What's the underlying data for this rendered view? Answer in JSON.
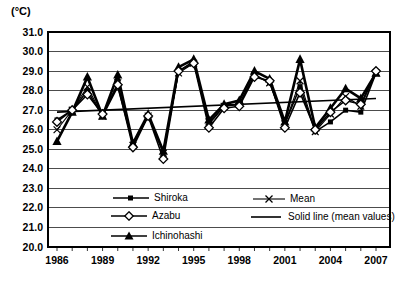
{
  "chart_data": {
    "type": "line",
    "title": "",
    "y_unit_label": "(°C)",
    "xlabel": "",
    "ylabel": "",
    "ylim": [
      20.0,
      31.0
    ],
    "ytick_step": 1.0,
    "grid": true,
    "line_color": "#000000",
    "x": [
      1986,
      1987,
      1988,
      1989,
      1990,
      1991,
      1992,
      1993,
      1994,
      1995,
      1996,
      1997,
      1998,
      1999,
      2000,
      2001,
      2002,
      2003,
      2004,
      2005,
      2006,
      2007
    ],
    "x_axis_tick_labels": [
      "1986",
      "1989",
      "1992",
      "1995",
      "1998",
      "2001",
      "2004",
      "2007"
    ],
    "series": [
      {
        "name": "Shiroka",
        "marker": "filled-square",
        "values": [
          26.5,
          27.0,
          28.0,
          26.7,
          28.2,
          25.3,
          26.7,
          24.9,
          29.0,
          29.5,
          26.3,
          27.2,
          27.3,
          28.8,
          28.4,
          26.3,
          28.2,
          25.9,
          26.4,
          27.0,
          26.9,
          28.9
        ]
      },
      {
        "name": "Azabu",
        "marker": "open-diamond",
        "values": [
          26.4,
          27.0,
          27.8,
          26.8,
          28.3,
          25.1,
          26.7,
          24.5,
          29.0,
          29.4,
          26.1,
          27.1,
          27.2,
          28.7,
          28.5,
          26.1,
          27.9,
          26.0,
          26.9,
          27.5,
          27.3,
          29.0
        ]
      },
      {
        "name": "Ichinohashi",
        "marker": "filled-triangle",
        "values": [
          25.4,
          26.9,
          28.7,
          26.7,
          28.8,
          25.3,
          26.8,
          24.9,
          29.2,
          29.6,
          26.5,
          27.3,
          27.5,
          29.0,
          28.6,
          26.4,
          29.6,
          26.1,
          27.1,
          28.1,
          27.6,
          28.9
        ]
      },
      {
        "name": "Mean",
        "marker": "x-cross",
        "values": [
          26.0,
          27.0,
          28.2,
          26.7,
          28.4,
          25.2,
          26.7,
          24.8,
          28.9,
          29.4,
          26.4,
          27.2,
          27.3,
          28.8,
          28.4,
          26.3,
          28.5,
          25.9,
          26.8,
          27.7,
          27.2,
          28.9
        ]
      }
    ],
    "trend": {
      "label": "Solid line (mean values)",
      "start": {
        "x": 1986,
        "y": 26.9
      },
      "end": {
        "x": 2007,
        "y": 27.6
      }
    },
    "legend_position": "inside-bottom-left"
  }
}
